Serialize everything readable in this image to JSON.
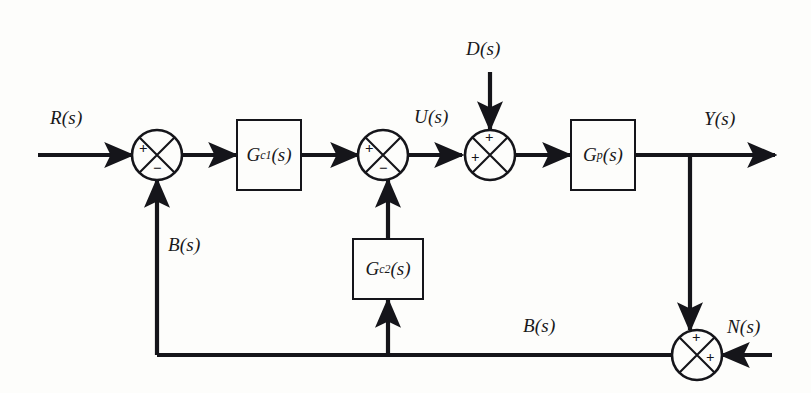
{
  "diagram": {
    "type": "control-system-block-diagram",
    "background_color": "#fdfdfb",
    "line_color": "#15151a",
    "signals": {
      "reference": "R(s)",
      "control": "U(s)",
      "disturbance": "D(s)",
      "output": "Y(s)",
      "noise": "N(s)",
      "feedback_inner": "B(s)",
      "feedback_outer": "B(s)"
    },
    "blocks": [
      {
        "id": "gc1",
        "name": "G",
        "sub": "c1",
        "tail": "(s)",
        "role": "forward-controller"
      },
      {
        "id": "gc2",
        "name": "G",
        "sub": "c2",
        "tail": "(s)",
        "role": "feedback-controller"
      },
      {
        "id": "gp",
        "name": "G",
        "sub": "p",
        "tail": "(s)",
        "role": "plant"
      }
    ],
    "junctions": [
      {
        "id": "sum1",
        "signs": {
          "left": "+",
          "bottom": "−"
        }
      },
      {
        "id": "sum2",
        "signs": {
          "left": "+",
          "bottom": "−"
        }
      },
      {
        "id": "sum3",
        "signs": {
          "left": "+",
          "top": "+"
        }
      },
      {
        "id": "sum4",
        "signs": {
          "right": "+",
          "top": "+"
        }
      }
    ]
  }
}
